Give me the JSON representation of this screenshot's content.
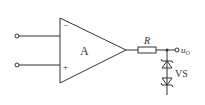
{
  "diagram": {
    "type": "op-amp voltage limiter circuit",
    "opamp": {
      "label": "A",
      "inverting_sign": "−",
      "noninverting_sign": "+"
    },
    "resistor": {
      "label": "R"
    },
    "output": {
      "label_main": "u",
      "label_sub": "O"
    },
    "zener": {
      "label": "VS"
    },
    "colors": {
      "line": "#333333",
      "background": "#ffffff"
    }
  }
}
